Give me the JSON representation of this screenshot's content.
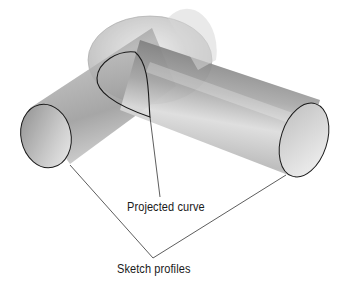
{
  "diagram": {
    "type": "3d-sweep-illustration",
    "labels": {
      "projected_curve": "Projected curve",
      "sketch_profiles": "Sketch profiles"
    },
    "colors": {
      "background": "#ffffff",
      "cylinder_dark": "#6e6e6e",
      "cylinder_light": "#e6e6e6",
      "outline": "#1a1a1a",
      "leader": "#333333"
    }
  }
}
